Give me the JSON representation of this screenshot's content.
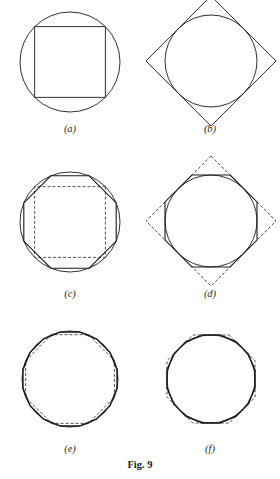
{
  "figure": {
    "caption": "Fig. 9",
    "caption_pos": {
      "x": 140,
      "y": 468
    },
    "background": "#ffffff",
    "ink": "#1a1a1a",
    "dash_ink": "#3a3a3a",
    "stroke_width_thin": 0.9,
    "stroke_width_solid": 1.1,
    "stroke_width_heavy": 1.5,
    "dash_pattern": "3,2"
  },
  "panels": [
    {
      "id": "a",
      "label": "(a)",
      "label_pos": {
        "x": 70,
        "y": 132
      },
      "center": {
        "x": 70,
        "y": 62
      },
      "radius": 50,
      "circle": true,
      "shapes": [
        {
          "role": "inscribed-polygon",
          "sides": 4,
          "rotation": 45,
          "style": "solid",
          "mode": "inscribed",
          "weight": "thin"
        }
      ]
    },
    {
      "id": "b",
      "label": "(b)",
      "label_pos": {
        "x": 210,
        "y": 132
      },
      "center": {
        "x": 211,
        "y": 61
      },
      "radius": 46,
      "circle": true,
      "shapes": [
        {
          "role": "circumscribed-square",
          "sides": 4,
          "rotation": 0,
          "style": "solid",
          "mode": "circumscribed",
          "weight": "thin"
        }
      ]
    },
    {
      "id": "c",
      "label": "(c)",
      "label_pos": {
        "x": 70,
        "y": 297
      },
      "center": {
        "x": 70,
        "y": 222
      },
      "radius": 50,
      "circle": true,
      "shapes": [
        {
          "role": "previous-inscribed-square",
          "sides": 4,
          "rotation": 45,
          "style": "dashed",
          "mode": "inscribed",
          "weight": "thin"
        },
        {
          "role": "inscribed-polygon",
          "sides": 8,
          "rotation": 22.5,
          "style": "solid",
          "mode": "inscribed",
          "weight": "solid"
        }
      ]
    },
    {
      "id": "d",
      "label": "(d)",
      "label_pos": {
        "x": 210,
        "y": 297
      },
      "center": {
        "x": 211,
        "y": 221
      },
      "radius": 46,
      "circle": true,
      "shapes": [
        {
          "role": "previous-circumscribed-square",
          "sides": 4,
          "rotation": 0,
          "style": "dashed",
          "mode": "circumscribed",
          "weight": "thin"
        },
        {
          "role": "circumscribed-polygon",
          "sides": 8,
          "rotation": 22.5,
          "style": "solid",
          "mode": "circumscribed",
          "weight": "solid"
        }
      ]
    },
    {
      "id": "e",
      "label": "(e)",
      "label_pos": {
        "x": 70,
        "y": 452
      },
      "center": {
        "x": 70,
        "y": 379
      },
      "radius": 48,
      "circle": true,
      "shapes": [
        {
          "role": "previous-inscribed-octagon",
          "sides": 8,
          "rotation": 22.5,
          "style": "dashed",
          "mode": "inscribed",
          "weight": "thin"
        },
        {
          "role": "inscribed-polygon",
          "sides": 16,
          "rotation": 11.25,
          "style": "solid",
          "mode": "inscribed",
          "weight": "heavy"
        }
      ]
    },
    {
      "id": "f",
      "label": "(f)",
      "label_pos": {
        "x": 210,
        "y": 452
      },
      "center": {
        "x": 211,
        "y": 379
      },
      "radius": 44,
      "circle": true,
      "shapes": [
        {
          "role": "previous-circumscribed-octagon",
          "sides": 8,
          "rotation": 22.5,
          "style": "dashed",
          "mode": "circumscribed",
          "weight": "thin"
        },
        {
          "role": "circumscribed-polygon",
          "sides": 16,
          "rotation": 11.25,
          "style": "solid",
          "mode": "circumscribed",
          "weight": "heavy"
        }
      ]
    }
  ]
}
